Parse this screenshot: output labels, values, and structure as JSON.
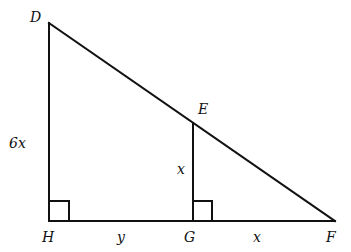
{
  "diagram": {
    "type": "geometry",
    "points": {
      "D": {
        "label": "D",
        "x": 49,
        "y": 23
      },
      "H": {
        "label": "H",
        "x": 49,
        "y": 221
      },
      "E": {
        "label": "E",
        "x": 193,
        "y": 123
      },
      "G": {
        "label": "G",
        "x": 193,
        "y": 221
      },
      "F": {
        "label": "F",
        "x": 335,
        "y": 221
      }
    },
    "segments": [
      {
        "from": "D",
        "to": "H"
      },
      {
        "from": "H",
        "to": "F"
      },
      {
        "from": "D",
        "to": "F"
      },
      {
        "from": "E",
        "to": "G"
      }
    ],
    "right_angles": [
      {
        "vertex": "H",
        "x": 49,
        "y": 201,
        "size": 20
      },
      {
        "vertex": "G",
        "x": 193,
        "y": 201,
        "size": 19
      }
    ],
    "segment_labels": {
      "DH": "6x",
      "EG": "x",
      "HG": "y",
      "GF": "x"
    },
    "colors": {
      "stroke": "#111111",
      "background": "#ffffff"
    }
  }
}
